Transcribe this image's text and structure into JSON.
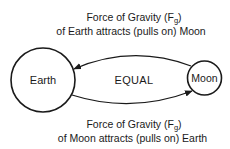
{
  "top_caption": {
    "line1_prefix": "Force of Gravity (F",
    "line1_sub": "g",
    "line1_suffix": ")",
    "line2": "of Earth attracts (pulls on) Moon"
  },
  "bottom_caption": {
    "line1_prefix": "Force of Gravity (F",
    "line1_sub": "g",
    "line1_suffix": ")",
    "line2": "of Moon attracts (pulls on) Earth"
  },
  "nodes": {
    "earth": {
      "label": "Earth"
    },
    "moon": {
      "label": "Moon"
    }
  },
  "center_label": "EQUAL",
  "colors": {
    "stroke": "#1a1a1a",
    "background": "#ffffff"
  }
}
